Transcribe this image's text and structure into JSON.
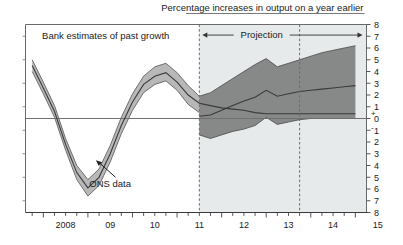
{
  "chart_data": {
    "type": "area",
    "title": "Percentage increases in output on a year earlier",
    "subtitle": "",
    "xlabel": "",
    "ylabel": "",
    "xlim": [
      2007.6,
      2015.25
    ],
    "ylim": [
      -8,
      8
    ],
    "grid": false,
    "legend_position": "none",
    "annotations": [
      {
        "name": "history-label",
        "text": "Bank estimates of past growth",
        "x": 2009.4,
        "y": 7.0
      },
      {
        "name": "projection-label",
        "text": "Projection",
        "x": 2012.9,
        "y": 7.1
      },
      {
        "name": "ons-label",
        "text": "ONS data",
        "x": 2009.5,
        "y": -5.6
      }
    ],
    "projection_start": 2011.5,
    "projection_marker_second": 2013.75,
    "yticks_top": [
      "8",
      "7",
      "6",
      "5",
      "4",
      "3",
      "2",
      "1",
      "0"
    ],
    "yticks_bottom": [
      "1",
      "2",
      "3",
      "4",
      "5",
      "6",
      "7",
      "8"
    ],
    "ytick_plus": "+",
    "ytick_minus": "-",
    "xticks": [
      "2008",
      "09",
      "10",
      "11",
      "12",
      "13",
      "14",
      "15"
    ],
    "xtick_values": [
      2008,
      2009,
      2010,
      2011,
      2012,
      2013,
      2014,
      2015
    ],
    "series": [
      {
        "name": "central",
        "x": [
          2007.75,
          2008.0,
          2008.25,
          2008.5,
          2008.75,
          2009.0,
          2009.25,
          2009.5,
          2009.75,
          2010.0,
          2010.25,
          2010.5,
          2010.75,
          2011.0,
          2011.25,
          2011.5,
          2011.75,
          2012.0,
          2012.25,
          2012.5,
          2012.75,
          2013.0,
          2013.25,
          2013.5,
          2013.75,
          2014.0,
          2014.25,
          2014.5,
          2014.75,
          2015.0
        ],
        "values": [
          4.5,
          2.6,
          0.6,
          -2.2,
          -4.6,
          -5.9,
          -5.0,
          -3.0,
          -0.6,
          1.4,
          2.9,
          3.6,
          3.9,
          3.1,
          2.0,
          1.3,
          1.1,
          0.9,
          0.8,
          0.7,
          0.5,
          0.4,
          0.4,
          0.4,
          0.4,
          0.4,
          0.4,
          0.4,
          0.4,
          0.4
        ]
      },
      {
        "name": "projection-central",
        "x": [
          2011.5,
          2011.75,
          2012.0,
          2012.25,
          2012.5,
          2012.75,
          2013.0,
          2013.25,
          2013.5,
          2013.75,
          2014.0,
          2014.25,
          2014.5,
          2014.75,
          2015.0
        ],
        "values": [
          0.2,
          0.3,
          0.7,
          1.1,
          1.5,
          1.8,
          2.4,
          1.9,
          2.1,
          2.3,
          2.4,
          2.5,
          2.6,
          2.7,
          2.8
        ]
      },
      {
        "name": "history-upper",
        "x": [
          2007.75,
          2008.0,
          2008.25,
          2008.5,
          2008.75,
          2009.0,
          2009.25,
          2009.5,
          2009.75,
          2010.0,
          2010.25,
          2010.5,
          2010.75,
          2011.0,
          2011.25,
          2011.5
        ],
        "values": [
          5.0,
          3.1,
          1.1,
          -1.7,
          -4.0,
          -5.2,
          -4.3,
          -2.3,
          0.1,
          2.1,
          3.6,
          4.4,
          4.7,
          3.9,
          2.8,
          1.9
        ]
      },
      {
        "name": "history-lower",
        "x": [
          2007.75,
          2008.0,
          2008.25,
          2008.5,
          2008.75,
          2009.0,
          2009.25,
          2009.5,
          2009.75,
          2010.0,
          2010.25,
          2010.5,
          2010.75,
          2011.0,
          2011.25,
          2011.5
        ],
        "values": [
          4.0,
          2.1,
          0.1,
          -2.7,
          -5.2,
          -6.6,
          -5.7,
          -3.7,
          -1.3,
          0.7,
          2.2,
          2.9,
          3.2,
          2.4,
          1.2,
          0.5
        ]
      },
      {
        "name": "projection-upper",
        "x": [
          2011.5,
          2011.75,
          2012.0,
          2012.25,
          2012.5,
          2012.75,
          2013.0,
          2013.25,
          2013.5,
          2013.75,
          2014.0,
          2014.25,
          2014.5,
          2014.75,
          2015.0
        ],
        "values": [
          1.9,
          2.2,
          2.8,
          3.4,
          4.0,
          4.6,
          5.1,
          4.4,
          4.7,
          5.0,
          5.3,
          5.6,
          5.8,
          6.0,
          6.2
        ]
      },
      {
        "name": "projection-lower",
        "x": [
          2011.5,
          2011.75,
          2012.0,
          2012.25,
          2012.5,
          2012.75,
          2013.0,
          2013.25,
          2013.5,
          2013.75,
          2014.0,
          2014.25,
          2014.5,
          2014.75,
          2015.0
        ],
        "values": [
          -1.4,
          -1.7,
          -1.4,
          -1.1,
          -0.9,
          -0.6,
          0.1,
          -0.5,
          -0.3,
          -0.1,
          0.0,
          0.0,
          0.0,
          0.0,
          0.0
        ]
      }
    ],
    "colors": {
      "fan_fill": "#7f7f7f",
      "fan_fill_light": "#b4b4b4",
      "central_line": "#3a3a3a",
      "projection_bg": "#e7eaea",
      "axis": "#6a6a6a",
      "text": "#222222",
      "page_bg": "#ffffff"
    }
  }
}
